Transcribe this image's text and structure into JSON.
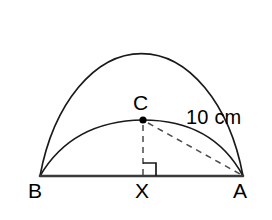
{
  "figure": {
    "colors": {
      "stroke": "#1a1a1a",
      "baseline": "#3a3a3a",
      "dashed": "#4a4a4a",
      "background": "#ffffff",
      "vertex_dot": "#000000"
    },
    "labels": {
      "point_c": "C",
      "point_b": "B",
      "point_x": "X",
      "point_a": "A",
      "measure_ca": "10 cm"
    },
    "points": {
      "B": {
        "x": 40,
        "y": 176
      },
      "A": {
        "x": 243,
        "y": 176
      },
      "C": {
        "x": 143,
        "y": 120
      },
      "X": {
        "x": 143,
        "y": 176
      }
    },
    "shapes": {
      "large_semicircle": {
        "type": "arc",
        "center_x": 141,
        "center_y": 176,
        "radius_x": 108,
        "radius_y": 172,
        "from_x": 40,
        "from_y": 176,
        "to_x": 243,
        "to_y": 176
      },
      "small_arc": {
        "type": "arc",
        "from_x": 40,
        "from_y": 176,
        "apex_x": 143,
        "apex_y": 120,
        "to_x": 243,
        "to_y": 176
      },
      "baseline": {
        "type": "segment",
        "from_x": 40,
        "from_y": 176,
        "to_x": 243,
        "to_y": 176
      },
      "perpendicular_cx": {
        "type": "dashed-segment",
        "from_x": 143,
        "from_y": 123,
        "to_x": 143,
        "to_y": 176
      },
      "chord_ca": {
        "type": "dashed-segment",
        "from_x": 147,
        "from_y": 122,
        "to_x": 241,
        "to_y": 175
      },
      "right_angle_marker": {
        "type": "square-marker",
        "at_point": "X",
        "size": 12,
        "opens": "upper-right"
      }
    }
  }
}
